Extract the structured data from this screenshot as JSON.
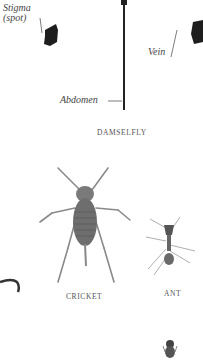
{
  "damselfly": {
    "caption": "DAMSELFLY",
    "labels": {
      "stigma_line1": "Stigma",
      "stigma_line2": "(spot)",
      "vein": "Vein",
      "abdomen": "Abdomen"
    }
  },
  "cricket": {
    "caption": "CRICKET"
  },
  "ant": {
    "caption": "ANT"
  },
  "colors": {
    "ink": "#333333",
    "wing_spot": "#1e1e1e",
    "background": "#ffffff"
  }
}
